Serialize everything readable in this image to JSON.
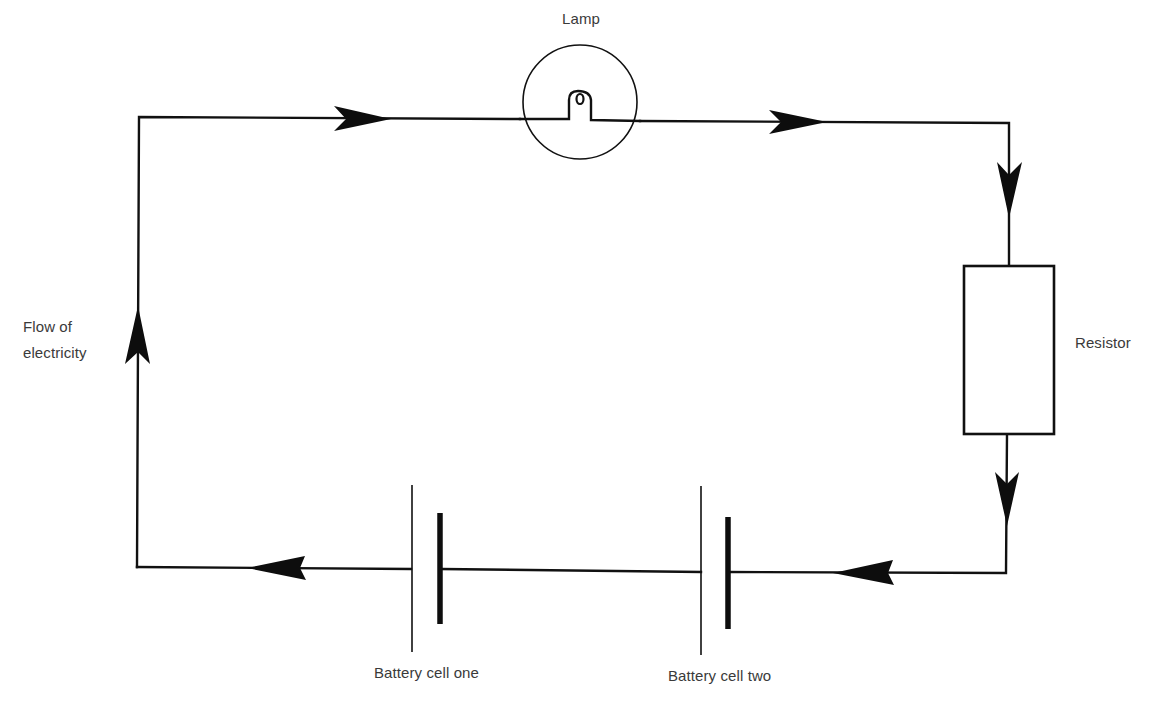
{
  "diagram": {
    "type": "circuit",
    "labels": {
      "lamp": "Lamp",
      "resistor": "Resistor",
      "flow_line1": "Flow of",
      "flow_line2": "electricity",
      "battery_one": "Battery cell one",
      "battery_two": "Battery cell two"
    },
    "components": [
      {
        "id": "lamp",
        "kind": "lamp",
        "label": "Lamp"
      },
      {
        "id": "resistor",
        "kind": "resistor",
        "label": "Resistor"
      },
      {
        "id": "battery_one",
        "kind": "battery-cell",
        "label": "Battery cell one"
      },
      {
        "id": "battery_two",
        "kind": "battery-cell",
        "label": "Battery cell two"
      }
    ],
    "flow_direction": "clockwise",
    "arrows": [
      {
        "position": "top-left",
        "direction": "right"
      },
      {
        "position": "top-right",
        "direction": "right"
      },
      {
        "position": "right-upper",
        "direction": "down"
      },
      {
        "position": "right-lower",
        "direction": "down"
      },
      {
        "position": "bottom-right",
        "direction": "left"
      },
      {
        "position": "bottom-left",
        "direction": "left"
      },
      {
        "position": "left",
        "direction": "up"
      }
    ],
    "colors": {
      "line": "#111111",
      "text": "#3a3a3a",
      "background": "#ffffff"
    }
  }
}
